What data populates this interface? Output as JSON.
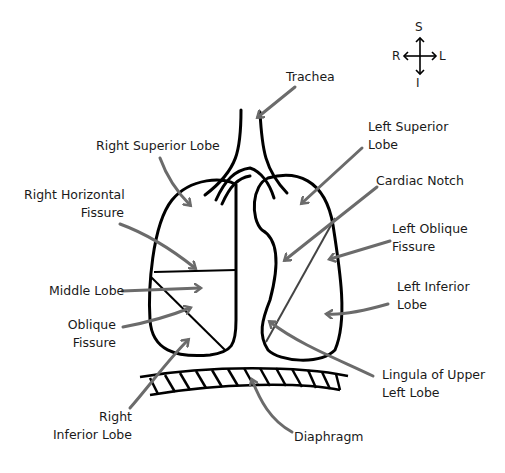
{
  "compass": {
    "superior": "S",
    "inferior": "I",
    "right": "R",
    "left": "L"
  },
  "labels": {
    "trachea": "Trachea",
    "right_superior_lobe": "Right Superior Lobe",
    "right_horizontal_fissure_1": "Right Horizontal",
    "right_horizontal_fissure_2": "Fissure",
    "middle_lobe": "Middle Lobe",
    "oblique_fissure_1": "Oblique",
    "oblique_fissure_2": "Fissure",
    "right_inferior_lobe_1": "Right",
    "right_inferior_lobe_2": "Inferior Lobe",
    "left_superior_lobe_1": "Left Superior",
    "left_superior_lobe_2": "Lobe",
    "cardiac_notch": "Cardiac Notch",
    "left_oblique_fissure_1": "Left Oblique",
    "left_oblique_fissure_2": "Fissure",
    "left_inferior_lobe_1": "Left Inferior",
    "left_inferior_lobe_2": "Lobe",
    "lingula_1": "Lingula of Upper",
    "lingula_2": "Left Lobe",
    "diaphragm": "Diaphragm"
  },
  "colors": {
    "outline": "#000000",
    "arrow": "#6b6b6b",
    "text": "#1a1a1a"
  }
}
